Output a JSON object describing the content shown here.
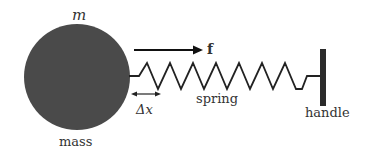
{
  "labels": {
    "mass_symbol": "m",
    "mass": "mass",
    "force": "f",
    "displacement": "Δx",
    "spring": "spring",
    "handle": "handle"
  },
  "colors": {
    "mass_fill": "#4a4a4a",
    "line": "#222222",
    "handle_fill": "#2b2b2b",
    "text": "#333333"
  }
}
